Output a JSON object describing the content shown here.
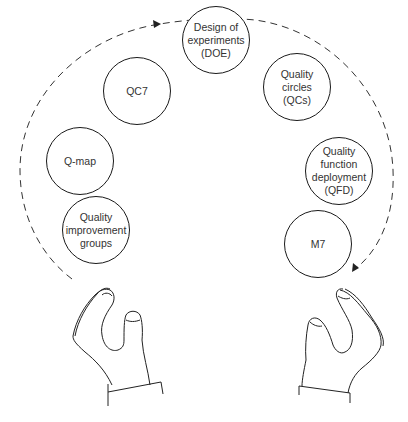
{
  "diagram": {
    "type": "juggling-hands-cycle",
    "colors": {
      "stroke": "#1a1a1a",
      "text": "#333333",
      "background": "#ffffff"
    },
    "nodes": [
      {
        "id": "qig",
        "label": "Quality\nimprovement\ngroups",
        "cx": 96,
        "cy": 230
      },
      {
        "id": "qmap",
        "label": "Q-map",
        "cx": 80,
        "cy": 161
      },
      {
        "id": "qc7",
        "label": "QC7",
        "cx": 137,
        "cy": 91
      },
      {
        "id": "doe",
        "label": "Design of\nexperiments\n(DOE)",
        "cx": 216,
        "cy": 40
      },
      {
        "id": "qcs",
        "label": "Quality\ncircles\n(QCs)",
        "cx": 297,
        "cy": 87
      },
      {
        "id": "qfd",
        "label": "Quality\nfunction\ndeployment\n(QFD)",
        "cx": 339,
        "cy": 171
      },
      {
        "id": "m7",
        "label": "M7",
        "cx": 318,
        "cy": 244
      }
    ],
    "arc": {
      "style": "dashed",
      "direction": "clockwise",
      "from": "left-hand",
      "to": "right-hand",
      "arrowheads": [
        "top-left",
        "bottom-right"
      ]
    },
    "hands": [
      "left-hand",
      "right-hand"
    ]
  }
}
